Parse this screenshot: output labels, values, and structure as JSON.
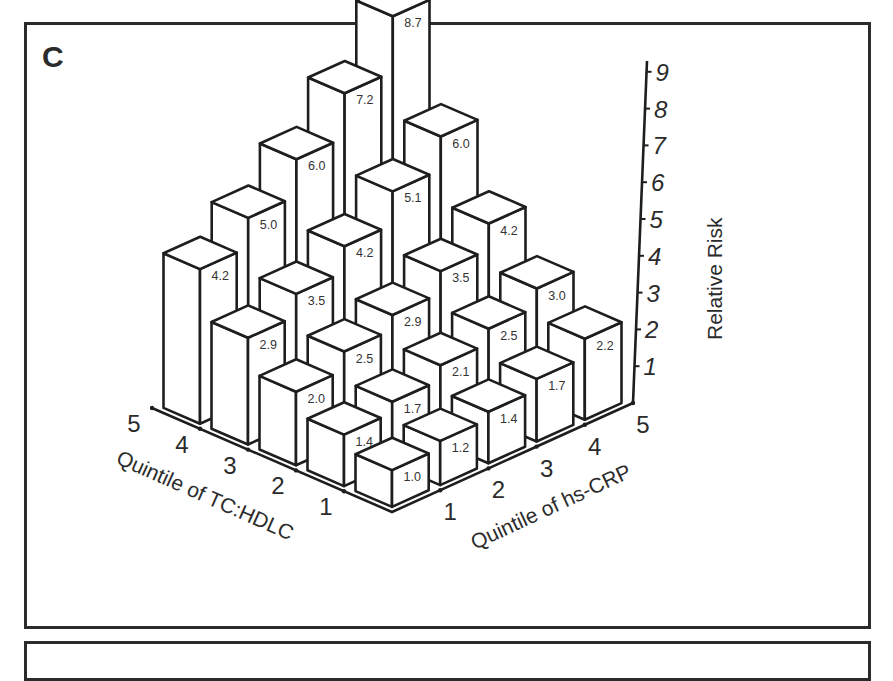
{
  "panel": {
    "label": "C"
  },
  "chart_data": {
    "type": "bar3d",
    "title": "",
    "panel_label": "C",
    "x_axis": {
      "label": "Quintile of TC:HDLC",
      "ticks": [
        "1",
        "2",
        "3",
        "4",
        "5"
      ]
    },
    "y_axis": {
      "label": "Quintile of hs-CRP",
      "ticks": [
        "1",
        "2",
        "3",
        "4",
        "5"
      ]
    },
    "z_axis": {
      "label": "Relative Risk",
      "ticks": [
        "1",
        "2",
        "3",
        "4",
        "5",
        "6",
        "7",
        "8",
        "9"
      ],
      "range": [
        0,
        9
      ]
    },
    "rows_key": "TC:HDLC quintile (1-5)",
    "cols_key": "hs-CRP quintile (1-5)",
    "values": [
      [
        1.0,
        1.2,
        1.4,
        1.7,
        2.2
      ],
      [
        1.4,
        1.7,
        2.1,
        2.5,
        3.0
      ],
      [
        2.0,
        2.5,
        2.9,
        3.5,
        4.2
      ],
      [
        2.9,
        3.5,
        4.2,
        5.1,
        6.0
      ],
      [
        4.2,
        5.0,
        6.0,
        7.2,
        8.7
      ]
    ],
    "value_labels": [
      [
        "1.0",
        "1.2",
        "1.4",
        "1.7",
        "2.2"
      ],
      [
        "1.4",
        "1.7",
        "2.1",
        "2.5",
        "3.0"
      ],
      [
        "2.0",
        "2.5",
        "2.9",
        "3.5",
        "4.2"
      ],
      [
        "2.9",
        "3.5",
        "4.2",
        "5.1",
        "6.0"
      ],
      [
        "4.2",
        "5.0",
        "6.0",
        "7.2",
        "8.7"
      ]
    ],
    "grid": false,
    "legend": null
  }
}
